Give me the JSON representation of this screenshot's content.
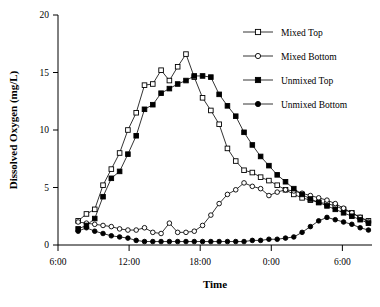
{
  "chart_data": {
    "type": "line",
    "title": "",
    "xlabel": "Time",
    "ylabel": "Dissolved Oxygen (mg/L)",
    "ylim": [
      0,
      20
    ],
    "yticks": [
      0,
      5,
      10,
      15,
      20
    ],
    "ytick_labels": [
      "0",
      "5",
      "10",
      "15",
      "20"
    ],
    "xlim_hours": [
      6,
      32.5
    ],
    "xticks_hours": [
      6,
      12,
      18,
      24,
      30
    ],
    "xtick_labels": [
      "6:00",
      "12:00",
      "18:00",
      "0:00",
      "6:00"
    ],
    "grid": false,
    "legend_position": "top-right",
    "x_hours": [
      7.7,
      8.4,
      9.1,
      9.8,
      10.5,
      11.2,
      11.9,
      12.6,
      13.3,
      14.0,
      14.7,
      15.4,
      16.1,
      16.8,
      17.5,
      18.2,
      18.9,
      19.6,
      20.3,
      21.0,
      21.7,
      22.4,
      23.1,
      23.8,
      24.5,
      25.2,
      25.9,
      26.6,
      27.3,
      28.0,
      28.7,
      29.4,
      30.1,
      30.8,
      31.5,
      32.2
    ],
    "series": [
      {
        "name": "Mixed Top",
        "marker": "open-square",
        "values": [
          2.1,
          2.7,
          3.1,
          5.2,
          6.6,
          8.0,
          10.0,
          11.5,
          13.9,
          14.0,
          15.2,
          14.3,
          15.5,
          16.6,
          14.6,
          12.8,
          11.7,
          10.5,
          8.4,
          7.3,
          6.5,
          6.3,
          5.9,
          5.6,
          5.2,
          4.8,
          4.4,
          4.1,
          3.9,
          3.7,
          3.6,
          3.4,
          3.1,
          2.8,
          2.4,
          2.1
        ]
      },
      {
        "name": "Mixed Bottom",
        "marker": "open-circle",
        "values": [
          2.0,
          1.9,
          1.8,
          1.7,
          1.6,
          1.4,
          1.3,
          1.3,
          1.5,
          1.1,
          1.0,
          1.9,
          1.1,
          1.1,
          1.2,
          1.7,
          2.6,
          3.6,
          4.4,
          4.8,
          5.4,
          5.1,
          4.9,
          4.3,
          4.6,
          4.8,
          4.7,
          4.5,
          4.3,
          4.1,
          3.9,
          3.6,
          3.2,
          2.8,
          2.4,
          2.0
        ]
      },
      {
        "name": "Unmixed Top",
        "marker": "filled-square",
        "values": [
          1.4,
          1.7,
          2.3,
          4.2,
          5.8,
          6.4,
          7.9,
          9.5,
          11.8,
          12.2,
          13.2,
          13.6,
          14.0,
          14.3,
          14.7,
          14.7,
          14.6,
          13.1,
          12.1,
          11.2,
          9.8,
          8.7,
          7.7,
          6.9,
          6.1,
          5.5,
          4.9,
          4.4,
          4.0,
          3.7,
          3.4,
          3.1,
          2.8,
          2.5,
          2.2,
          1.9
        ]
      },
      {
        "name": "Unmixed Bottom",
        "marker": "filled-circle",
        "values": [
          1.2,
          1.5,
          1.2,
          1.0,
          0.8,
          0.7,
          0.6,
          0.4,
          0.3,
          0.3,
          0.3,
          0.3,
          0.3,
          0.3,
          0.3,
          0.3,
          0.3,
          0.3,
          0.3,
          0.3,
          0.3,
          0.4,
          0.4,
          0.5,
          0.5,
          0.6,
          0.7,
          1.1,
          1.6,
          2.1,
          2.4,
          2.2,
          2.0,
          1.8,
          1.5,
          1.3
        ]
      }
    ],
    "legend": [
      {
        "label": "Mixed Top",
        "marker": "open-square"
      },
      {
        "label": "Mixed Bottom",
        "marker": "open-circle"
      },
      {
        "label": "Unmixed Top",
        "marker": "filled-square"
      },
      {
        "label": "Unmixed Bottom",
        "marker": "filled-circle"
      }
    ],
    "colors": {
      "line": "#000000",
      "marker_fill_open": "#ffffff",
      "marker_fill_closed": "#000000",
      "axis": "#000000",
      "background": "#ffffff"
    }
  }
}
